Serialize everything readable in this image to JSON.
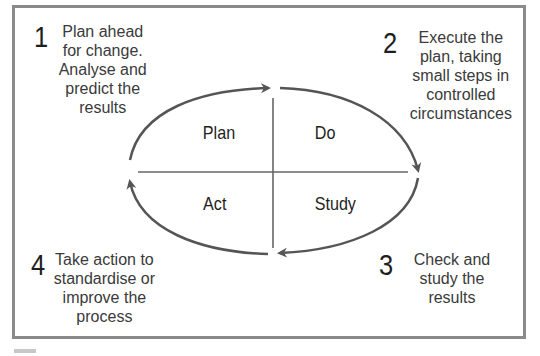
{
  "diagram": {
    "type": "PDSA cycle",
    "quadrants": [
      {
        "label": "Plan"
      },
      {
        "label": "Do"
      },
      {
        "label": "Study"
      },
      {
        "label": "Act"
      }
    ],
    "steps": [
      {
        "number": "1",
        "text": "Plan ahead\nfor change.\nAnalyse and\npredict the\nresults"
      },
      {
        "number": "2",
        "text": "Execute the\nplan, taking\nsmall steps in\ncontrolled\ncircumstances"
      },
      {
        "number": "3",
        "text": "Check and\nstudy the\nresults"
      },
      {
        "number": "4",
        "text": "Take action to\nstandardise or\nimprove the\nprocess"
      }
    ],
    "colors": {
      "frame": "#8a8a8a",
      "arrow": "#555555",
      "text": "#2a2a2a"
    }
  }
}
